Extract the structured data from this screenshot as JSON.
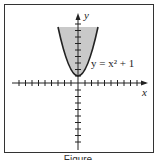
{
  "figure": {
    "equation_label": "y = x² + 1",
    "x_axis_label": "x",
    "y_axis_label": "y",
    "caption": "Figure",
    "shade_color": "#c9c9c9",
    "curve_color": "#222222",
    "region": "y ≥ x² + 1 (shaded above parabola)"
  }
}
